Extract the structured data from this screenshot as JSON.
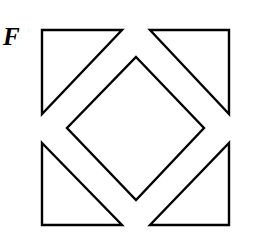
{
  "figure": {
    "label": "F",
    "stroke_color": "#000000",
    "background": "#ffffff",
    "shapes": [
      {
        "name": "top-left-triangle",
        "points": "42,30 122,30 42,114"
      },
      {
        "name": "top-right-triangle",
        "points": "150,30 229,30 229,114"
      },
      {
        "name": "center-diamond",
        "points": "136,57 204,128 136,200 67,128"
      },
      {
        "name": "bottom-left-triangle",
        "points": "42,143 122,225 42,225"
      },
      {
        "name": "bottom-right-triangle",
        "points": "229,143 229,225 150,225"
      }
    ]
  }
}
